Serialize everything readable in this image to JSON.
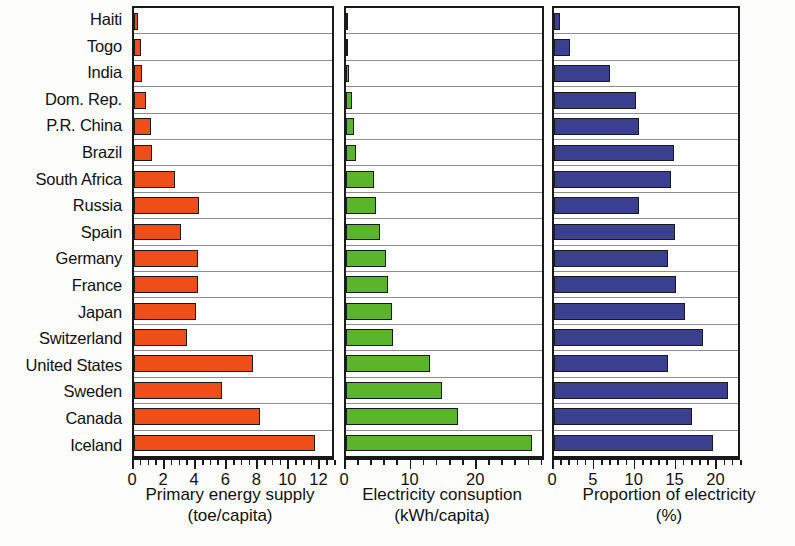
{
  "chart_data": {
    "type": "bar",
    "title": "",
    "orientation": "horizontal",
    "categories": [
      "Haiti",
      "Togo",
      "India",
      "Dom. Rep.",
      "P.R. China",
      "Brazil",
      "South Africa",
      "Russia",
      "Spain",
      "Germany",
      "France",
      "Japan",
      "Switzerland",
      "United States",
      "Sweden",
      "Canada",
      "Iceland"
    ],
    "panels": [
      {
        "id": "primary-energy-supply",
        "xlabel": "Primary energy supply",
        "unit": "(toe/capita)",
        "color": "#f04e18",
        "xlim": [
          0,
          13
        ],
        "ticks": [
          0,
          2,
          4,
          6,
          8,
          10,
          12
        ],
        "tick_labels": [
          "0",
          "2",
          "4",
          "6",
          "8",
          "10",
          "12"
        ],
        "minor_tick_step": 0.5,
        "grid": true,
        "values": [
          0.25,
          0.45,
          0.5,
          0.8,
          1.1,
          1.15,
          2.7,
          4.3,
          3.1,
          4.2,
          4.2,
          4.1,
          3.45,
          7.8,
          5.8,
          8.3,
          11.9
        ]
      },
      {
        "id": "electricity-consumption",
        "xlabel": "Electricity consuption",
        "unit": "(kWh/capita)",
        "color": "#5ab52b",
        "xlim": [
          0,
          30.5
        ],
        "ticks": [
          0,
          10,
          20
        ],
        "tick_labels": [
          "0",
          "10",
          "20"
        ],
        "minor_tick_step": 2,
        "grid": true,
        "values": [
          0.05,
          0.08,
          0.4,
          0.9,
          1.2,
          1.6,
          4.4,
          4.6,
          5.3,
          6.2,
          6.6,
          7.1,
          7.3,
          13.0,
          15.0,
          17.5,
          29.0
        ]
      },
      {
        "id": "proportion-of-electricity",
        "xlabel": "Proportion of electricity",
        "unit": "(%)",
        "color": "#3b3f8f",
        "xlim": [
          0,
          23
        ],
        "ticks": [
          0,
          5,
          10,
          15,
          20
        ],
        "tick_labels": [
          "0",
          "5",
          "10",
          "15",
          "20"
        ],
        "minor_tick_step": 1,
        "grid": true,
        "values": [
          0.8,
          2.0,
          7.0,
          10.2,
          10.6,
          15.0,
          14.6,
          10.6,
          15.1,
          14.2,
          15.2,
          16.4,
          18.6,
          14.3,
          21.8,
          17.3,
          19.9
        ]
      }
    ]
  }
}
